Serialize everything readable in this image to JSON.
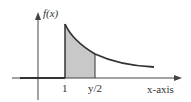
{
  "diagram": {
    "y_axis_label": "f(x)",
    "x_axis_label": "x-axis",
    "tick_labels": [
      "1",
      "y/2"
    ],
    "colors": {
      "axis": "#333333",
      "curve": "#333333",
      "shade": "#c8c8c8",
      "background": "#ffffff"
    }
  }
}
